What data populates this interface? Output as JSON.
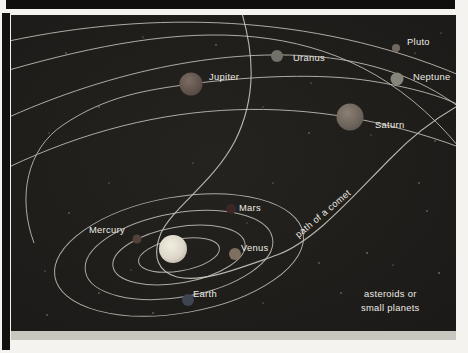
{
  "figure": {
    "background_color": "#22201e",
    "background_edge_color": "#1b1a18",
    "orbit_line_color": "#c7c3ba",
    "label_color": "#edebe4",
    "star_color": "#a29f96",
    "labels": {
      "mercury": "Mercury",
      "venus": "Venus",
      "earth": "Earth",
      "mars": "Mars",
      "jupiter": "Jupiter",
      "saturn": "Saturn",
      "uranus": "Uranus",
      "neptune": "Neptune",
      "pluto": "Pluto"
    },
    "annotations": {
      "comet": "path of a comet",
      "asteroids_line1": "asteroids or",
      "asteroids_line2": "small planets"
    },
    "planet_colors": {
      "sun": "#e8e4d6",
      "mercury": "#53413a",
      "venus": "#7e7060",
      "earth": "#3e4550",
      "mars": "#3c2726",
      "jupiter": "#6f6057",
      "saturn": "#7e7369",
      "uranus": "#71716a",
      "neptune": "#87847a",
      "pluto": "#6f6860"
    },
    "stars": [
      [
        55,
        38,
        0.7
      ],
      [
        132,
        22,
        0.6
      ],
      [
        205,
        30,
        0.7
      ],
      [
        88,
        92,
        0.7
      ],
      [
        38,
        118,
        0.6
      ],
      [
        252,
        92,
        0.6
      ],
      [
        298,
        118,
        0.7
      ],
      [
        404,
        38,
        0.6
      ],
      [
        424,
        126,
        0.7
      ],
      [
        58,
        198,
        0.7
      ],
      [
        98,
        168,
        0.6
      ],
      [
        262,
        168,
        0.6
      ],
      [
        308,
        248,
        0.7
      ],
      [
        356,
        238,
        0.8
      ],
      [
        416,
        196,
        0.7
      ],
      [
        428,
        258,
        0.8
      ],
      [
        88,
        278,
        0.7
      ],
      [
        142,
        298,
        0.7
      ],
      [
        252,
        288,
        0.6
      ],
      [
        330,
        278,
        0.7
      ],
      [
        34,
        256,
        0.6
      ],
      [
        382,
        250,
        0.6
      ],
      [
        182,
        148,
        0.6
      ],
      [
        408,
        168,
        0.7
      ],
      [
        300,
        68,
        0.6
      ],
      [
        236,
        208,
        0.5
      ],
      [
        120,
        255,
        0.5
      ],
      [
        430,
        18,
        0.6
      ],
      [
        360,
        120,
        0.5
      ],
      [
        36,
        300,
        0.7
      ]
    ]
  }
}
